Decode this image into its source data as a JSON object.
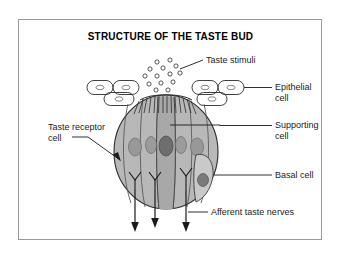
{
  "figure": {
    "title": "STRUCTURE OF THE TASTE BUD",
    "border_color": "#9a9a9a",
    "background_color": "#ffffff"
  },
  "labels": {
    "taste_stimuli": "Taste stimuli",
    "epithelial_cell_line1": "Epithelial",
    "epithelial_cell_line2": "cell",
    "supporting_cell_line1": "Supporting",
    "supporting_cell_line2": "cell",
    "basal_cell": "Basal cell",
    "afferent_taste_nerves": "Afferent taste nerves",
    "taste_receptor_cell_line1": "Taste receptor",
    "taste_receptor_cell_line2": "cell"
  },
  "diagram": {
    "bud_fill": "#b8b8b8",
    "bud_stroke": "#2b2b2b",
    "supporting_cell_fill": "#c4c4c4",
    "receptor_cell_fill": "#aeaeae",
    "nucleus_fill": "#9b9b9b",
    "receptor_nucleus_fill": "#6e6e6e",
    "basal_cell_fill": "#c9c9c9",
    "epithelial_fill": "#ffffff",
    "stimuli_count": 13,
    "nuclei_count": 5,
    "nerve_endings_count": 3,
    "afferent_arrows_count": 3,
    "microvilli_count": 14
  }
}
